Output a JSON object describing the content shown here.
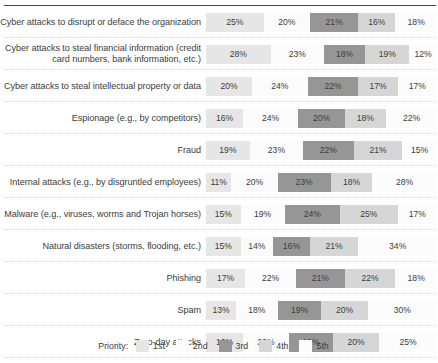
{
  "chart_data": {
    "type": "bar",
    "subtype": "100% stacked horizontal bar",
    "title": "",
    "xlabel": "",
    "ylabel": "",
    "xlim": [
      0,
      100
    ],
    "grid": false,
    "legend_position": "bottom",
    "legend_title": "Priority:",
    "categories": [
      "Cyber attacks to disrupt or deface the organization",
      "Cyber attacks to steal financial information (credit card numbers, bank information, etc.)",
      "Cyber attacks to steal intellectual property or data",
      "Espionage (e.g., by competitors)",
      "Fraud",
      "Internal attacks (e.g., by disgruntled employees)",
      "Malware (e.g., viruses, worms and Trojan horses)",
      "Natural disasters (storms, flooding, etc.)",
      "Phishing",
      "Spam",
      "Zero-day attacks"
    ],
    "series": [
      {
        "name": "1st",
        "color": "#e6e6e6",
        "values": [
          25,
          28,
          20,
          16,
          19,
          11,
          15,
          15,
          17,
          13,
          16
        ]
      },
      {
        "name": "2nd",
        "color": "#fbfbfb",
        "values": [
          20,
          23,
          24,
          24,
          23,
          20,
          19,
          14,
          22,
          18,
          20
        ]
      },
      {
        "name": "3rd",
        "color": "#969696",
        "values": [
          21,
          18,
          22,
          20,
          22,
          23,
          24,
          16,
          21,
          19,
          19
        ]
      },
      {
        "name": "4th",
        "color": "#d6d6d6",
        "values": [
          16,
          19,
          17,
          18,
          21,
          18,
          25,
          21,
          22,
          20,
          20
        ]
      },
      {
        "name": "5th",
        "color": "#fcfcfc",
        "values": [
          18,
          12,
          17,
          22,
          15,
          28,
          17,
          34,
          18,
          30,
          25
        ]
      }
    ],
    "value_labels": [
      [
        "25%",
        "20%",
        "21%",
        "16%",
        "18%"
      ],
      [
        "28%",
        "23%",
        "18%",
        "19%",
        "12%"
      ],
      [
        "20%",
        "24%",
        "22%",
        "17%",
        "17%"
      ],
      [
        "16%",
        "24%",
        "20%",
        "18%",
        "22%"
      ],
      [
        "19%",
        "23%",
        "22%",
        "21%",
        "15%"
      ],
      [
        "11%",
        "20%",
        "23%",
        "18%",
        "28%"
      ],
      [
        "15%",
        "19%",
        "24%",
        "25%",
        "17%"
      ],
      [
        "15%",
        "14%",
        "16%",
        "21%",
        "34%"
      ],
      [
        "17%",
        "22%",
        "21%",
        "22%",
        "18%"
      ],
      [
        "13%",
        "18%",
        "19%",
        "20%",
        "30%"
      ],
      [
        "16%",
        "20%",
        "19%",
        "20%",
        "25%"
      ]
    ]
  },
  "legend": {
    "title": "Priority:",
    "items": [
      {
        "label": "1st",
        "color": "#e6e6e6"
      },
      {
        "label": "2nd",
        "color": "#fbfbfb"
      },
      {
        "label": "3rd",
        "color": "#969696"
      },
      {
        "label": "4th",
        "color": "#d6d6d6"
      },
      {
        "label": "5th",
        "color": "#fcfcfc"
      }
    ]
  },
  "colors": {
    "top_rule": "#4a4a4a",
    "row_separator": "#d9d9d9",
    "text": "#3c3c3c",
    "background": "#ffffff"
  }
}
